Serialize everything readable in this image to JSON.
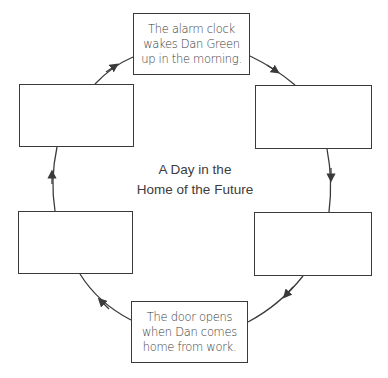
{
  "diagram": {
    "type": "cycle",
    "direction": "clockwise",
    "title_lines": [
      "A Day in the",
      "Home of the Future"
    ],
    "colors": {
      "stroke": "#3a3a3a",
      "text": "#3a3a3a",
      "background": "#ffffff"
    },
    "boxes": [
      {
        "id": "top",
        "position": "top",
        "lines": [
          "The alarm clock",
          "wakes Dan Green",
          "up in the morning."
        ]
      },
      {
        "id": "right-top",
        "position": "upper-right",
        "lines": []
      },
      {
        "id": "right-bottom",
        "position": "lower-right",
        "lines": []
      },
      {
        "id": "bottom",
        "position": "bottom",
        "lines": [
          "The door opens",
          "when Dan comes",
          "home from work."
        ]
      },
      {
        "id": "left-bottom",
        "position": "lower-left",
        "lines": []
      },
      {
        "id": "left-top",
        "position": "upper-left",
        "lines": []
      }
    ],
    "arrows": [
      {
        "from": "top",
        "to": "right-top"
      },
      {
        "from": "right-top",
        "to": "right-bottom"
      },
      {
        "from": "right-bottom",
        "to": "bottom"
      },
      {
        "from": "bottom",
        "to": "left-bottom"
      },
      {
        "from": "left-bottom",
        "to": "left-top"
      },
      {
        "from": "left-top",
        "to": "top"
      }
    ]
  }
}
